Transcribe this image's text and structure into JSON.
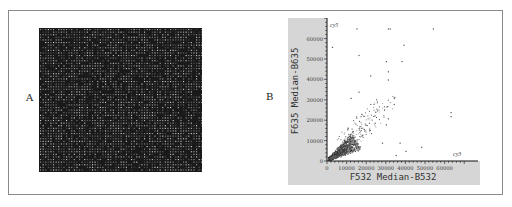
{
  "figure": {
    "panels": [
      {
        "label": "A",
        "description": "Microarray scan image"
      },
      {
        "label": "B",
        "description": "Scatter plot of two-channel intensities"
      }
    ]
  },
  "chart_data": {
    "type": "scatter",
    "title": "",
    "xlabel": "F532 Median-B532",
    "ylabel": "F635 Median-B635",
    "xlim": [
      0,
      70000
    ],
    "ylim": [
      0,
      70000
    ],
    "x_ticks": [
      "0",
      "10000",
      "20000",
      "30000",
      "40000",
      "50000",
      "60000"
    ],
    "y_ticks": [
      "0",
      "10000",
      "20000",
      "30000",
      "40000",
      "50000",
      "60000"
    ],
    "annotations": [
      {
        "text": "cy5",
        "position": "top-left"
      },
      {
        "text": "cy3",
        "position": "bottom-right"
      }
    ],
    "grid": false,
    "legend": null,
    "series": [
      {
        "name": "spots",
        "points_description": "Dense cluster near origin (0-15000) elongated along the diagonal, with sparse outliers up to ~65000",
        "outliers": [
          [
            2500,
            56000
          ],
          [
            16000,
            52000
          ],
          [
            15000,
            65000
          ],
          [
            31000,
            65000
          ],
          [
            32000,
            65000
          ],
          [
            54000,
            65000
          ],
          [
            39000,
            57000
          ],
          [
            30000,
            49000
          ],
          [
            38000,
            49000
          ],
          [
            31000,
            44000
          ],
          [
            31000,
            40000
          ],
          [
            22000,
            42000
          ],
          [
            16000,
            34000
          ],
          [
            12000,
            31000
          ],
          [
            34000,
            31000
          ],
          [
            34000,
            28000
          ],
          [
            63000,
            24000
          ],
          [
            63000,
            22000
          ],
          [
            31000,
            21000
          ],
          [
            30000,
            18000
          ],
          [
            48000,
            7000
          ],
          [
            40000,
            5000
          ],
          [
            37000,
            9000
          ],
          [
            28000,
            9000
          ],
          [
            35000,
            3000
          ]
        ]
      }
    ],
    "colors": {
      "panel_background": "#d6d6d6",
      "plot_background": "#ffffff",
      "points": "#333333",
      "axes": "#111111"
    }
  }
}
